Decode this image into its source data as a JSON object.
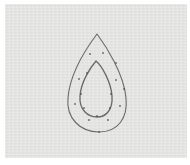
{
  "image": {
    "description": "Pencil sketch of a teardrop shape with a smaller inner teardrop outline and scattered dots on textured gray paper",
    "colors": {
      "paper": "#e6e6e4",
      "border": "#ffffff",
      "pencil": "#4a4a4a"
    },
    "shapes": {
      "outer_teardrop": {
        "path": "M97,34 C88,46 70,72 68,98 C66,118 80,132 99,132 C118,132 128,118 126,98 C124,74 106,46 97,34 Z"
      },
      "inner_teardrop": {
        "path": "M96,61 C90,68 81,82 80,96 C79,110 88,117 97,117 C106,117 113,110 112,96 C111,82 102,66 96,61 Z"
      }
    },
    "dots": [
      {
        "x": 90,
        "y": 54
      },
      {
        "x": 103,
        "y": 53
      },
      {
        "x": 116,
        "y": 63
      },
      {
        "x": 87,
        "y": 73
      },
      {
        "x": 79,
        "y": 79
      },
      {
        "x": 116,
        "y": 80
      },
      {
        "x": 124,
        "y": 89
      },
      {
        "x": 81,
        "y": 94
      },
      {
        "x": 111,
        "y": 94
      },
      {
        "x": 75,
        "y": 104
      },
      {
        "x": 84,
        "y": 108
      },
      {
        "x": 110,
        "y": 108
      },
      {
        "x": 120,
        "y": 106
      },
      {
        "x": 97,
        "y": 116
      },
      {
        "x": 89,
        "y": 120
      },
      {
        "x": 108,
        "y": 120
      },
      {
        "x": 99,
        "y": 132
      }
    ]
  }
}
